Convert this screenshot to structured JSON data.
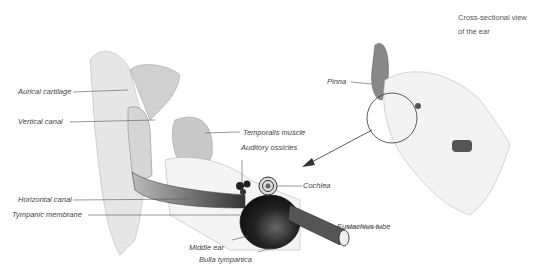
{
  "title": {
    "line1": "Cross-sectional view",
    "line2": "of the ear"
  },
  "labels": {
    "auricular_cartilage": "Aurical cartilage",
    "vertical_canal": "Vertical canal",
    "temporalis_muscle": "Temporalis muscle",
    "auditory_ossicles": "Auditory ossicles",
    "horizontal_canal": "Horizontal canal",
    "cochlea": "Cochlea",
    "tympanic_membrane": "Tympanic membrane",
    "eustachius_tube": "Eustachius tube",
    "middle_ear": "Middle ear",
    "bulla_tympanica": "Bulla tympanica",
    "pinna": "Pinna"
  },
  "colors": {
    "text": "#444444",
    "leader": "#555555",
    "tissue_light": "#d9d9d9",
    "tissue_dark": "#2a2a2a"
  }
}
